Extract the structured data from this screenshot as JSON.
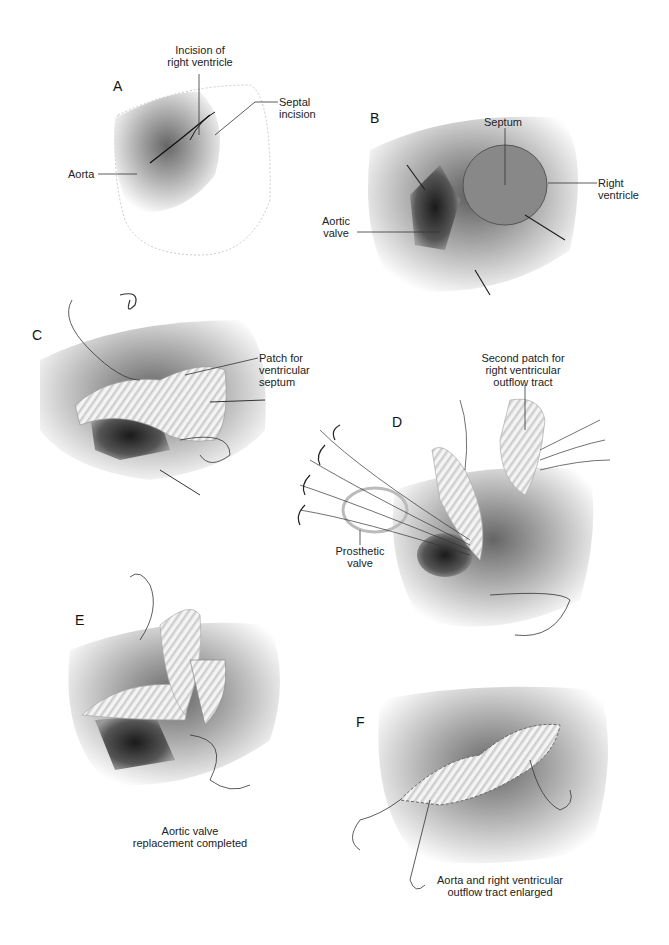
{
  "figure": {
    "panels": [
      {
        "id": "A",
        "letter": "A",
        "labels": {
          "incision_rv": "Incision of\nright ventricle",
          "septal_incision": "Septal\nincision",
          "aorta": "Aorta"
        }
      },
      {
        "id": "B",
        "letter": "B",
        "labels": {
          "septum": "Septum",
          "right_ventricle": "Right\nventricle",
          "aortic_valve": "Aortic\nvalve"
        }
      },
      {
        "id": "C",
        "letter": "C",
        "labels": {
          "patch_vs": "Patch for\nventricular\nseptum"
        }
      },
      {
        "id": "D",
        "letter": "D",
        "labels": {
          "second_patch": "Second patch for\nright ventricular\noutflow tract",
          "prosthetic_valve": "Prosthetic\nvalve"
        }
      },
      {
        "id": "E",
        "letter": "E",
        "caption": "Aortic valve\nreplacement completed"
      },
      {
        "id": "F",
        "letter": "F",
        "caption": "Aorta and right ventricular\noutflow tract enlarged"
      }
    ]
  }
}
